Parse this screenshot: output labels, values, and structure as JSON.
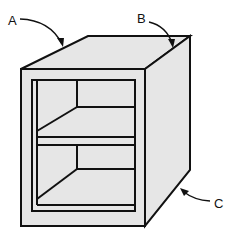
{
  "diagram": {
    "labels": [
      {
        "id": "A",
        "text": "A",
        "points_to": "top-front-left edge"
      },
      {
        "id": "B",
        "text": "B",
        "points_to": "top-right edge"
      },
      {
        "id": "C",
        "text": "C",
        "points_to": "bottom-right side edge"
      }
    ],
    "colors": {
      "fill": "#e6e6e6",
      "stroke": "#111111"
    }
  }
}
